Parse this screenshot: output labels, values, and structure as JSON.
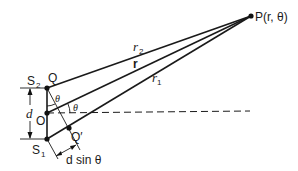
{
  "diagram": {
    "points": {
      "P": "P(r, θ)",
      "Q": "Q",
      "O": "O",
      "Q_prime": "Q′",
      "S1": "S",
      "S1_sub": "1",
      "S2": "S",
      "S2_sub": "2"
    },
    "rays": {
      "r2": "r",
      "r2_sub": "2",
      "r": "r",
      "r1": "r",
      "r1_sub": "1"
    },
    "angles": {
      "theta_at_Q": "θ",
      "theta_at_O": "θ"
    },
    "dimensions": {
      "separation": "d",
      "path_difference": "d sin θ"
    }
  }
}
